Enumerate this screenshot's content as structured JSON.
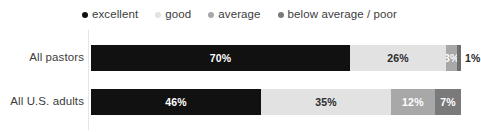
{
  "legend": {
    "items": [
      {
        "label": "excellent",
        "color": "#111111",
        "icon": "legend-dot-icon"
      },
      {
        "label": "good",
        "color": "#e2e2e2",
        "icon": "legend-dot-icon"
      },
      {
        "label": "average",
        "color": "#a8a8a8",
        "icon": "legend-dot-icon"
      },
      {
        "label": "below average / poor",
        "color": "#7a7a7a",
        "icon": "legend-dot-icon"
      }
    ]
  },
  "chart_data": {
    "type": "bar",
    "orientation": "horizontal",
    "stacked": true,
    "stacked_percent": true,
    "title": "",
    "subtitle": "",
    "xlabel": "",
    "ylabel": "",
    "xlim": [
      0,
      100
    ],
    "grid": false,
    "legend_position": "top-center",
    "categories": [
      "All pastors",
      "All U.S. adults"
    ],
    "series": [
      {
        "name": "excellent",
        "color": "#111111",
        "label_color": "#ffffff",
        "values": [
          70,
          46
        ],
        "value_labels": [
          "70%",
          "46%"
        ]
      },
      {
        "name": "good",
        "color": "#e2e2e2",
        "label_color": "#2b2b2b",
        "values": [
          26,
          35
        ],
        "value_labels": [
          "26%",
          "35%"
        ]
      },
      {
        "name": "average",
        "color": "#a8a8a8",
        "label_color": "#ffffff",
        "values": [
          3,
          12
        ],
        "value_labels": [
          "3%",
          "12%"
        ]
      },
      {
        "name": "below average / poor",
        "color": "#7a7a7a",
        "label_color": "#ffffff",
        "values": [
          1,
          7
        ],
        "value_labels": [
          "1%",
          "7%"
        ]
      }
    ],
    "rows": [
      {
        "category": "All pastors",
        "segments": [
          {
            "name": "excellent",
            "value": 70,
            "value_label": "70%",
            "color": "#111111",
            "label_color": "#ffffff",
            "label_inside": true
          },
          {
            "name": "good",
            "value": 26,
            "value_label": "26%",
            "color": "#e2e2e2",
            "label_color": "#2b2b2b",
            "label_inside": true
          },
          {
            "name": "average",
            "value": 3,
            "value_label": "3%",
            "color": "#a8a8a8",
            "label_color": "#ffffff",
            "label_inside": true
          },
          {
            "name": "below average / poor",
            "value": 1,
            "value_label": "1%",
            "color": "#6e6e6e",
            "label_color": "#2b2b2b",
            "label_inside": false
          }
        ]
      },
      {
        "category": "All U.S. adults",
        "segments": [
          {
            "name": "excellent",
            "value": 46,
            "value_label": "46%",
            "color": "#111111",
            "label_color": "#ffffff",
            "label_inside": true
          },
          {
            "name": "good",
            "value": 35,
            "value_label": "35%",
            "color": "#e2e2e2",
            "label_color": "#2b2b2b",
            "label_inside": true
          },
          {
            "name": "average",
            "value": 12,
            "value_label": "12%",
            "color": "#a8a8a8",
            "label_color": "#ffffff",
            "label_inside": true
          },
          {
            "name": "below average / poor",
            "value": 7,
            "value_label": "7%",
            "color": "#7a7a7a",
            "label_color": "#ffffff",
            "label_inside": true
          }
        ]
      }
    ]
  }
}
